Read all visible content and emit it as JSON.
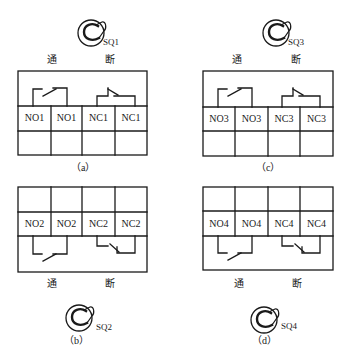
{
  "panels": {
    "a": {
      "caption": "（a）",
      "switch_label": "SQ1",
      "on_label": "通",
      "off_label": "断",
      "cells": [
        "NO1",
        "NO1",
        "NC1",
        "NC1"
      ]
    },
    "b": {
      "caption": "（b）",
      "switch_label": "SQ2",
      "on_label": "通",
      "off_label": "断",
      "cells": [
        "NO2",
        "NO2",
        "NC2",
        "NC2"
      ]
    },
    "c": {
      "caption": "（c）",
      "switch_label": "SQ3",
      "on_label": "通",
      "off_label": "断",
      "cells": [
        "NO3",
        "NO3",
        "NC3",
        "NC3"
      ]
    },
    "d": {
      "caption": "（d）",
      "switch_label": "SQ4",
      "on_label": "通",
      "off_label": "断",
      "cells": [
        "NO4",
        "NO4",
        "NC4",
        "NC4"
      ]
    }
  },
  "colors": {
    "line": "#1a1a1a",
    "background": "#ffffff"
  }
}
